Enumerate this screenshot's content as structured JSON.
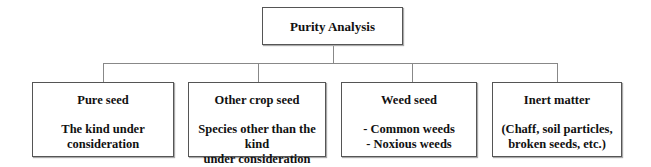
{
  "root": {
    "label": "Purity Analysis"
  },
  "children": [
    {
      "title": "Pure seed",
      "lines": [
        "The kind under consideration"
      ]
    },
    {
      "title": "Other crop seed",
      "lines": [
        "Species other than the kind",
        "under consideration"
      ]
    },
    {
      "title": "Weed seed",
      "lines": [
        "- Common weeds",
        "- Noxious weeds"
      ]
    },
    {
      "title": "Inert matter",
      "lines": [
        "(Chaff, soil particles,",
        "broken seeds, etc.)"
      ]
    }
  ],
  "colors": {
    "border": "#555555",
    "connector": "#888888",
    "text": "#111111"
  }
}
